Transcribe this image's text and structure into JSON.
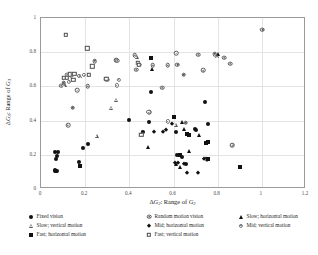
{
  "chart_data": {
    "type": "scatter",
    "title": "",
    "xlabel": "ΔG₂: Range of G₂",
    "ylabel": "ΔG₃: Range of G₃",
    "xlim": [
      0,
      1.2
    ],
    "ylim": [
      0,
      1
    ],
    "xticks": [
      "0",
      "0.2",
      "0.4",
      "0.6",
      "0.8",
      "1",
      "1.2"
    ],
    "yticks": [
      "0",
      "0.2",
      "0.4",
      "0.6",
      "0.8",
      "1"
    ],
    "grid": true,
    "legend_position": "below",
    "series": [
      {
        "name": "Fixed vision",
        "marker": "filled-circle",
        "color": "#111111",
        "points": [
          [
            0.062,
            0.215
          ],
          [
            0.075,
            0.216
          ],
          [
            0.071,
            0.193
          ],
          [
            0.068,
            0.178
          ],
          [
            0.062,
            0.107
          ],
          [
            0.066,
            0.104
          ],
          [
            0.072,
            0.108
          ],
          [
            0.064,
            0.112
          ],
          [
            0.174,
            0.158
          ],
          [
            0.192,
            0.239
          ],
          [
            0.214,
            0.265
          ],
          [
            0.398,
            0.405
          ],
          [
            0.462,
            0.333
          ],
          [
            0.487,
            0.392
          ],
          [
            0.497,
            0.567
          ],
          [
            0.612,
            0.333
          ],
          [
            0.617,
            0.196
          ],
          [
            0.639,
            0.19
          ],
          [
            0.658,
            0.146
          ],
          [
            0.744,
            0.508
          ],
          [
            0.757,
            0.378
          ],
          [
            0.697,
            0.352
          ],
          [
            0.704,
            0.345
          ]
        ]
      },
      {
        "name": "Random motion vision",
        "marker": "sun-circle",
        "color": "#555555",
        "points": [
          [
            0.102,
            0.621
          ],
          [
            0.092,
            0.604
          ],
          [
            0.118,
            0.668
          ],
          [
            0.136,
            0.667
          ],
          [
            0.163,
            0.579
          ],
          [
            0.144,
            0.475
          ],
          [
            0.122,
            0.374
          ],
          [
            0.211,
            0.602
          ],
          [
            0.243,
            0.749
          ],
          [
            0.295,
            0.642
          ],
          [
            0.302,
            0.638
          ],
          [
            0.34,
            0.754
          ],
          [
            0.346,
            0.75
          ],
          [
            0.424,
            0.781
          ],
          [
            0.432,
            0.697
          ],
          [
            0.444,
            0.727
          ],
          [
            0.489,
            0.449
          ],
          [
            0.505,
            0.723
          ],
          [
            0.548,
            0.593
          ],
          [
            0.574,
            0.724
          ],
          [
            0.612,
            0.795
          ],
          [
            0.618,
            0.727
          ],
          [
            0.646,
            0.668
          ],
          [
            0.655,
            0.388
          ],
          [
            0.712,
            0.785
          ],
          [
            0.734,
            0.693
          ],
          [
            0.786,
            0.79
          ],
          [
            0.829,
            0.768
          ],
          [
            0.856,
            0.733
          ],
          [
            0.866,
            0.256
          ],
          [
            1.003,
            0.932
          ]
        ]
      },
      {
        "name": "Slow; horizontal motion",
        "marker": "filled-triangle",
        "color": "#111111",
        "points": [
          [
            0.459,
            0.331
          ],
          [
            0.484,
            0.245
          ],
          [
            0.613,
            0.145
          ],
          [
            0.628,
            0.131
          ],
          [
            0.64,
            0.39
          ],
          [
            0.648,
            0.349
          ],
          [
            0.672,
            0.221
          ],
          [
            0.717,
            0.313
          ],
          [
            0.503,
            0.701
          ],
          [
            0.801,
            0.787
          ]
        ]
      },
      {
        "name": "Slow; vertical motion",
        "marker": "open-triangle",
        "color": "#5a5a5a",
        "points": [
          [
            0.099,
            0.617
          ],
          [
            0.168,
            0.67
          ],
          [
            0.243,
            0.322
          ],
          [
            0.309,
            0.487
          ],
          [
            0.331,
            0.534
          ],
          [
            0.425,
            0.784
          ],
          [
            0.602,
            0.386
          ],
          [
            0.789,
            0.788
          ]
        ]
      },
      {
        "name": "Mid; horizontal motion",
        "marker": "filled-diamond",
        "color": "#111111",
        "points": [
          [
            0.513,
            0.336
          ],
          [
            0.554,
            0.333
          ],
          [
            0.605,
            0.153
          ],
          [
            0.622,
            0.152
          ],
          [
            0.648,
            0.145
          ],
          [
            0.663,
            0.093
          ],
          [
            0.71,
            0.094
          ],
          [
            0.737,
            0.176
          ],
          [
            0.748,
            0.173
          ],
          [
            0.592,
            0.378
          ],
          [
            0.568,
            0.344
          ]
        ]
      },
      {
        "name": "Mid; vertical motion",
        "marker": "small-sun",
        "color": "#777777",
        "points": [
          [
            0.128,
            0.628
          ],
          [
            0.173,
            0.662
          ],
          [
            0.196,
            0.665
          ],
          [
            0.343,
            0.606
          ],
          [
            0.352,
            0.64
          ],
          [
            0.486,
            0.449
          ],
          [
            0.573,
            0.395
          ],
          [
            0.752,
            0.172
          ],
          [
            0.866,
            0.256
          ]
        ]
      },
      {
        "name": "Fast; horizontal motion",
        "marker": "filled-square",
        "color": "#111111",
        "points": [
          [
            0.175,
            0.133
          ],
          [
            0.497,
            0.769
          ],
          [
            0.603,
            0.42
          ],
          [
            0.629,
            0.199
          ],
          [
            0.662,
            0.32
          ],
          [
            0.672,
            0.313
          ],
          [
            0.745,
            0.269
          ],
          [
            0.757,
            0.272
          ],
          [
            0.755,
            0.177
          ],
          [
            0.903,
            0.13
          ]
        ]
      },
      {
        "name": "Fast; vertical motion",
        "marker": "open-square",
        "color": "#4d4d4d",
        "points": [
          [
            0.111,
            0.903
          ],
          [
            0.104,
            0.651
          ],
          [
            0.117,
            0.65
          ],
          [
            0.13,
            0.671
          ],
          [
            0.15,
            0.672
          ],
          [
            0.209,
            0.822
          ],
          [
            0.232,
            0.718
          ],
          [
            0.296,
            0.646
          ],
          [
            0.438,
            0.737
          ],
          [
            0.443,
            0.726
          ],
          [
            0.455,
            0.318
          ],
          [
            0.217,
            0.667
          ],
          [
            0.147,
            0.64
          ]
        ]
      }
    ]
  },
  "legend": {
    "entries": [
      {
        "label": "Fixed vision",
        "marker": "filled-circle"
      },
      {
        "label": "Random motion vision",
        "marker": "sun-circle"
      },
      {
        "label": "Slow; horizontal motion",
        "marker": "filled-triangle"
      },
      {
        "label": "Slow; vertical motion",
        "marker": "open-triangle"
      },
      {
        "label": "Mid; horizontal motion",
        "marker": "filled-diamond"
      },
      {
        "label": "Mid; vertical motion",
        "marker": "small-sun"
      },
      {
        "label": "Fast; horizontal motion",
        "marker": "filled-square"
      },
      {
        "label": "Fast; vertical motion",
        "marker": "open-square"
      }
    ]
  }
}
